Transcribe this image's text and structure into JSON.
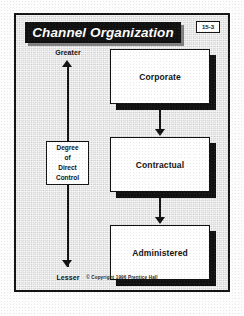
{
  "slide": {
    "title": "Channel Organization",
    "badge": "15-3",
    "footer": "© Copyright 1996 Prentice Hall"
  },
  "axis": {
    "top_label": "Greater",
    "bottom_label": "Lesser",
    "caption": {
      "line1": "Degree",
      "line2": "of",
      "line3": "Direct",
      "line4": "Control"
    }
  },
  "chart_data": {
    "type": "diagram",
    "title": "Channel Organization",
    "orientation": "vertical",
    "nodes": [
      {
        "id": "corporate",
        "label": "Corporate",
        "order": 1
      },
      {
        "id": "contractual",
        "label": "Contractual",
        "order": 2
      },
      {
        "id": "administered",
        "label": "Administered",
        "order": 3
      }
    ],
    "edges": [
      {
        "from": "corporate",
        "to": "contractual",
        "style": "arrow-down"
      },
      {
        "from": "contractual",
        "to": "administered",
        "style": "arrow-down"
      }
    ],
    "axis": {
      "label": "Degree of Direct Control",
      "high_end": "Greater",
      "low_end": "Lesser",
      "direction": "decreasing downward"
    },
    "colors": {
      "ink": "#111111",
      "node_fill": "#ffffff",
      "background": "#d9d9d9",
      "title_bar": "#101010"
    }
  }
}
